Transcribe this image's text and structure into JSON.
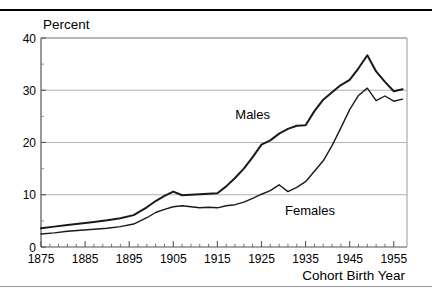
{
  "figure": {
    "partial_top_caption": "",
    "background_color": "#ffffff",
    "line_color": "#1a1a1a",
    "grid_color": "#a8a8a8",
    "axis_color": "#555555"
  },
  "chart_data": {
    "type": "line",
    "title": "",
    "xlabel": "Cohort Birth Year",
    "ylabel": "Percent",
    "xlim": [
      1875,
      1958
    ],
    "ylim": [
      0,
      40
    ],
    "xticks": [
      1875,
      1885,
      1895,
      1905,
      1915,
      1925,
      1935,
      1945,
      1955
    ],
    "xtick_labels": [
      "1875",
      "1885",
      "1895",
      "1905",
      "1915",
      "1925",
      "1935",
      "1945",
      "1955"
    ],
    "xminor_step": 2,
    "yticks": [
      0,
      10,
      20,
      30,
      40
    ],
    "ytick_labels": [
      "0",
      "10",
      "20",
      "30",
      "40"
    ],
    "yminor": [
      5,
      15,
      25,
      35
    ],
    "grid": "horizontal-major",
    "legend": "inline-annotations",
    "series": [
      {
        "name": "Males",
        "label_x": 1923,
        "label_y": 24.5,
        "x": [
          1875,
          1878,
          1881,
          1884,
          1887,
          1890,
          1893,
          1896,
          1899,
          1901,
          1903,
          1905,
          1907,
          1909,
          1911,
          1913,
          1915,
          1917,
          1919,
          1921,
          1923,
          1925,
          1927,
          1929,
          1931,
          1933,
          1935,
          1937,
          1939,
          1941,
          1943,
          1945,
          1947,
          1949,
          1951,
          1953,
          1955,
          1957
        ],
        "values": [
          3.6,
          3.9,
          4.2,
          4.5,
          4.8,
          5.1,
          5.5,
          6.1,
          7.6,
          8.8,
          9.8,
          10.6,
          9.9,
          10.0,
          10.1,
          10.2,
          10.3,
          11.6,
          13.2,
          15.0,
          17.2,
          19.6,
          20.4,
          21.7,
          22.6,
          23.2,
          23.3,
          26.0,
          28.2,
          29.6,
          31.0,
          32.0,
          34.2,
          36.7,
          33.6,
          31.6,
          29.8,
          30.2
        ]
      },
      {
        "name": "Females",
        "label_x": 1936,
        "label_y": 6.2,
        "x": [
          1875,
          1878,
          1881,
          1884,
          1887,
          1890,
          1893,
          1896,
          1899,
          1901,
          1903,
          1905,
          1907,
          1909,
          1911,
          1913,
          1915,
          1917,
          1919,
          1921,
          1923,
          1925,
          1927,
          1929,
          1931,
          1933,
          1935,
          1937,
          1939,
          1941,
          1943,
          1945,
          1947,
          1949,
          1951,
          1953,
          1955,
          1957
        ],
        "values": [
          2.5,
          2.7,
          3.0,
          3.2,
          3.4,
          3.6,
          3.9,
          4.4,
          5.6,
          6.6,
          7.2,
          7.7,
          7.9,
          7.7,
          7.5,
          7.6,
          7.5,
          7.9,
          8.1,
          8.6,
          9.3,
          10.1,
          10.8,
          11.9,
          10.6,
          11.4,
          12.5,
          14.5,
          16.5,
          19.4,
          22.8,
          26.3,
          29.0,
          30.4,
          28.0,
          28.9,
          27.9,
          28.3
        ]
      }
    ]
  },
  "axis_labels": {
    "y_axis_name": "Percent",
    "x_axis_name": "Cohort Birth Year"
  }
}
